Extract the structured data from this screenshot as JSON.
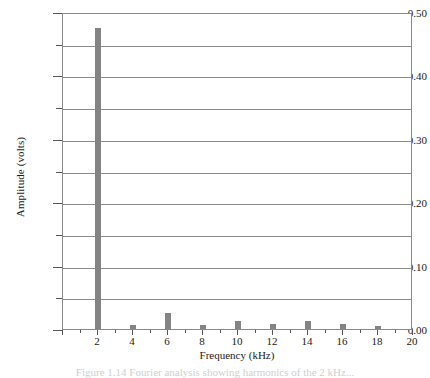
{
  "chart_data": {
    "type": "bar",
    "title": "",
    "xlabel": "Frequency (kHz)",
    "ylabel": "Amplitude (volts)",
    "x": [
      2,
      4,
      6,
      8,
      10,
      12,
      14,
      16,
      18
    ],
    "values": [
      0.475,
      0.006,
      0.025,
      0.006,
      0.012,
      0.008,
      0.012,
      0.008,
      0.005
    ],
    "categories": [
      "2",
      "4",
      "6",
      "8",
      "10",
      "12",
      "14",
      "16",
      "18"
    ],
    "xlim": [
      0,
      20
    ],
    "ylim": [
      0.0,
      0.5
    ],
    "xticks": [
      0,
      2,
      4,
      6,
      8,
      10,
      12,
      14,
      16,
      18,
      20
    ],
    "xtick_labels": [
      "",
      "2",
      "4",
      "6",
      "8",
      "10",
      "12",
      "14",
      "16",
      "18",
      "20"
    ],
    "xticks_minor": [
      1,
      3,
      5,
      7,
      9,
      11,
      13,
      15,
      17,
      19
    ],
    "yticks": [
      0.0,
      0.1,
      0.2,
      0.3,
      0.4,
      0.5
    ],
    "ytick_labels": [
      "0.00",
      "0.10",
      "0.20",
      "0.30",
      "0.40",
      "0.50"
    ],
    "yticks_minor": [
      0.05,
      0.15,
      0.25,
      0.35,
      0.45
    ],
    "gridlines_y": [
      0.05,
      0.1,
      0.15,
      0.2,
      0.25,
      0.3,
      0.35,
      0.4,
      0.45
    ],
    "grid": "horizontal",
    "legend": "none",
    "bar_color": "#848484",
    "frame_color": "#8a8a8a",
    "bar_width_units": 0.35
  },
  "axis": {
    "ylabel": "Amplitude (volts)",
    "xlabel": "Frequency (kHz)"
  },
  "caption": {
    "text": "Figure 1.14   Fourier analysis showing harmonics of the 2 kHz..."
  }
}
